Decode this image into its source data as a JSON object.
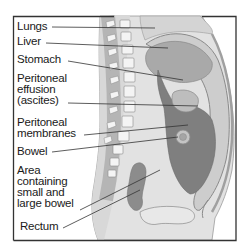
{
  "diagram": {
    "type": "anatomical cross-section",
    "labels": [
      {
        "id": "lungs",
        "text": "Lungs"
      },
      {
        "id": "liver",
        "text": "Liver"
      },
      {
        "id": "stomach",
        "text": "Stomach"
      },
      {
        "id": "peritoneal-effusion",
        "text": "Peritoneal\neffusion\n(ascites)"
      },
      {
        "id": "peritoneal-membranes",
        "text": "Peritoneal\nmembranes"
      },
      {
        "id": "bowel",
        "text": "Bowel"
      },
      {
        "id": "area-bowel",
        "text": "Area\ncontaining\nsmall and\nlarge bowel"
      },
      {
        "id": "rectum",
        "text": "Rectum"
      }
    ],
    "colors": {
      "frame": "#333333",
      "body_light": "#e2e2e2",
      "body_mid": "#cfcfcf",
      "organ_mid": "#a9a9a9",
      "fluid_dark": "#7f7f7f",
      "vertebra": "#f4f4f4",
      "outline": "#8a8a8a",
      "leader_line": "#333333",
      "text": "#1a1a1a"
    }
  }
}
